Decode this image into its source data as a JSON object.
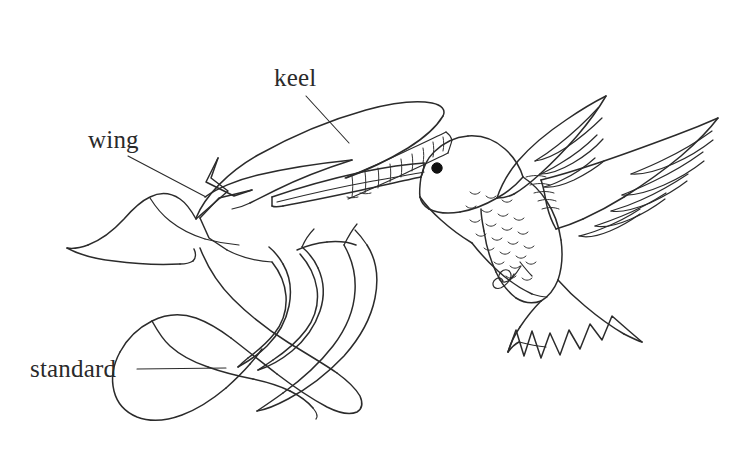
{
  "figure": {
    "kind": "line-drawing",
    "style": "black ink line art on white background",
    "background_color": "#ffffff",
    "ink_color": "#2b2b2b",
    "width": 750,
    "height": 473
  },
  "labels": [
    {
      "id": "keel",
      "text": "keel",
      "text_x": 274,
      "text_y": 86,
      "leader": {
        "x1": 306,
        "y1": 96,
        "x2": 349,
        "y2": 143
      }
    },
    {
      "id": "wing",
      "text": "wing",
      "text_x": 88,
      "text_y": 148,
      "leader": {
        "x1": 128,
        "y1": 156,
        "x2": 206,
        "y2": 197
      }
    },
    {
      "id": "standard",
      "text": "standard",
      "text_x": 30,
      "text_y": 377,
      "leader": {
        "x1": 137,
        "y1": 369,
        "x2": 226,
        "y2": 368
      }
    }
  ],
  "parts": {
    "flower": {
      "name": "flower",
      "petals": [
        "standard",
        "wing",
        "keel"
      ]
    },
    "bird": {
      "name": "hummingbird",
      "features": [
        "beak",
        "eye",
        "head",
        "breast-scales",
        "upper-wing",
        "lower-wing",
        "tail",
        "feet"
      ],
      "eye": {
        "cx": 437,
        "cy": 168,
        "r": 5
      }
    }
  },
  "colors": {
    "ink": "#2b2b2b",
    "ink_fine": "#333333",
    "eye": "#111111",
    "paper": "#ffffff"
  }
}
